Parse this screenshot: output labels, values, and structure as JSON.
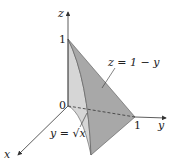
{
  "diagram": {
    "axes": {
      "z_label": "z",
      "y_label": "y",
      "x_label": "x",
      "z_tick": "1",
      "y_tick": "1",
      "origin": "0"
    },
    "annotations": {
      "plane": "z = 1 − y",
      "curve": "y = √x"
    },
    "colors": {
      "surface_light": "#d4d4d4",
      "surface_dark": "#a9a9a9",
      "axis": "#333333"
    }
  }
}
